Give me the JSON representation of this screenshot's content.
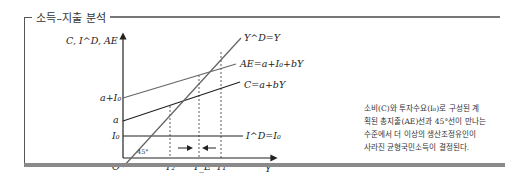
{
  "title": "소득–지출 분석",
  "diagram": {
    "y_axis_label": "C, I^D, AE",
    "x_axis_label": "Y",
    "origin_label": "O",
    "angle_label": "45°",
    "intercepts": {
      "a_plus_I0": "a+I₀",
      "a": "a",
      "I0": "I₀"
    },
    "lines": {
      "forty_five": "Y^D=Y",
      "ae": "AE=a+I₀+bY",
      "consumption": "C=a+bY",
      "investment": "I^D=I₀"
    },
    "x_ticks": [
      "Y₂",
      "Y_E",
      "Y₁"
    ],
    "arrows": [
      "→",
      "←"
    ]
  },
  "description": [
    "소비(C)와 투자수요(I₀)로 구성된 계",
    "획된 총지출(AE)선과 45°선이 만나는",
    "수준에서 더 이상의 생산조정유인이",
    "사라진 균형국민소득이 결정된다."
  ],
  "colors": {
    "frame": "#555555",
    "bottom_bar": "#8a8a8a",
    "line_dark": "#222222",
    "line_gray": "#666666"
  }
}
